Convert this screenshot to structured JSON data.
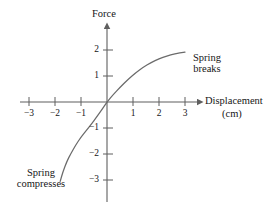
{
  "figure": {
    "background_color": "#ffffff",
    "line_color": "#6b6b6b",
    "axis_color": "#5f5f5f",
    "text_color": "#161616"
  },
  "axes": {
    "y_axis_title": "Force",
    "x_axis_title": "Displacement",
    "x_axis_units": "(cm)",
    "x_ticks": [
      {
        "value": -3,
        "label": "−3"
      },
      {
        "value": -2,
        "label": "−2"
      },
      {
        "value": -1,
        "label": "−1"
      },
      {
        "value": 1,
        "label": "1"
      },
      {
        "value": 2,
        "label": "2"
      },
      {
        "value": 3,
        "label": "3"
      }
    ],
    "y_ticks": [
      {
        "value": 2,
        "label": "2"
      },
      {
        "value": 1,
        "label": "1"
      },
      {
        "value": -1,
        "label": "−1"
      },
      {
        "value": -2,
        "label": "−2"
      },
      {
        "value": -3,
        "label": "−3"
      }
    ]
  },
  "annotations": [
    {
      "id": "spring-breaks",
      "line1": "Spring",
      "line2": "breaks"
    },
    {
      "id": "spring-compresses",
      "line1": "Spring",
      "line2": "compresses"
    }
  ],
  "chart_data": {
    "type": "line",
    "title": "",
    "xlabel": "Displacement (cm)",
    "ylabel": "Force",
    "xlim": [
      -3.6,
      3.6
    ],
    "ylim": [
      -3.4,
      2.6
    ],
    "grid": false,
    "legend": "none",
    "series": [
      {
        "name": "Force vs Displacement",
        "x": [
          -1.8,
          -1.7,
          -1.55,
          -1.4,
          -1.2,
          -1.0,
          -0.8,
          -0.6,
          -0.4,
          -0.2,
          0.0,
          0.25,
          0.5,
          0.8,
          1.1,
          1.4,
          1.7,
          2.0,
          2.3,
          2.6,
          3.0
        ],
        "y": [
          -3.05,
          -2.7,
          -2.3,
          -2.0,
          -1.65,
          -1.35,
          -1.1,
          -0.85,
          -0.58,
          -0.3,
          0.0,
          0.3,
          0.56,
          0.86,
          1.12,
          1.34,
          1.52,
          1.66,
          1.77,
          1.85,
          1.92
        ]
      }
    ],
    "annotations": [
      {
        "text": "Spring breaks",
        "x": 3.0,
        "y": 1.5
      },
      {
        "text": "Spring compresses",
        "x": -2.8,
        "y": -2.9
      }
    ]
  }
}
